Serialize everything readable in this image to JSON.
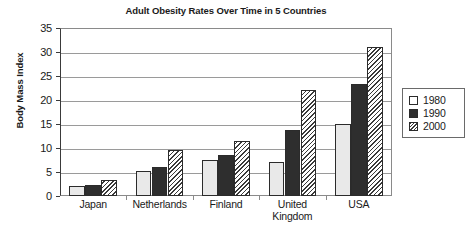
{
  "chart_data": {
    "type": "bar",
    "title": "Adult Obesity Rates Over Time in 5 Countries",
    "xlabel": "",
    "ylabel": "Body Mass Index",
    "ylim": [
      0,
      35
    ],
    "ytick_step": 5,
    "yticks": [
      0,
      5,
      10,
      15,
      20,
      25,
      30,
      35
    ],
    "grid": "horizontal",
    "legend_position": "right",
    "categories": [
      "Japan",
      "Netherlands",
      "Finland",
      "United Kingdom",
      "USA"
    ],
    "series": [
      {
        "name": "1980",
        "values": [
          2.1,
          5.2,
          7.5,
          7.0,
          15.1
        ]
      },
      {
        "name": "1990",
        "values": [
          2.3,
          6.1,
          8.5,
          13.8,
          23.3
        ]
      },
      {
        "name": "2000",
        "values": [
          3.4,
          9.5,
          11.4,
          22.1,
          31.0
        ]
      }
    ]
  },
  "legend": {
    "entries": [
      {
        "label": "1980",
        "style": "light-fill"
      },
      {
        "label": "1990",
        "style": "dark-fill"
      },
      {
        "label": "2000",
        "style": "diagonal-hatch"
      }
    ]
  },
  "category_label_lines": [
    [
      "Japan"
    ],
    [
      "Netherlands"
    ],
    [
      "Finland"
    ],
    [
      "United",
      "Kingdom"
    ],
    [
      "USA"
    ]
  ],
  "colors": {
    "series_1980": "#e9e9e9",
    "series_1990": "#2e2e2e",
    "series_2000_hatch": "#3a3a3a",
    "gridline": "#9a9a9a",
    "axis": "#3a3a3a",
    "text": "#1a1a1a",
    "background": "#ffffff"
  }
}
